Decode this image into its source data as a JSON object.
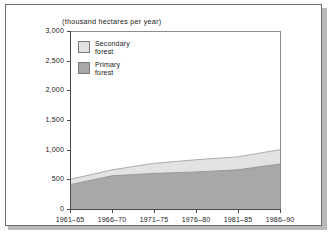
{
  "chart_data": {
    "type": "area",
    "title": "(thousand hectares per year)",
    "xlabel": "",
    "ylabel": "",
    "ylim": [
      0,
      3000
    ],
    "ytick_labels": [
      "0",
      "500",
      "1,000",
      "1,500",
      "2,000",
      "2,500",
      "3,000"
    ],
    "ytick_values": [
      0,
      500,
      1000,
      1500,
      2000,
      2500,
      3000
    ],
    "categories": [
      "1961-65",
      "1966-70",
      "1971-75",
      "1976-80",
      "1981-85",
      "1986-90"
    ],
    "stacked": true,
    "grid": false,
    "legend_position": "upper-left",
    "series": [
      {
        "name": "Primary forest",
        "color": "#a8a8a8",
        "values": [
          410,
          560,
          600,
          625,
          660,
          760
        ]
      },
      {
        "name": "Secondary forest",
        "color": "#e2e2e2",
        "values": [
          90,
          100,
          170,
          205,
          220,
          240
        ]
      }
    ],
    "totals": [
      500,
      660,
      770,
      830,
      880,
      1000
    ]
  },
  "legend": {
    "items": [
      {
        "label": "Secondary\nforest",
        "color": "#e2e2e2"
      },
      {
        "label": "Primary\nforest",
        "color": "#a8a8a8"
      }
    ]
  },
  "colors": {
    "primary_forest": "#a8a8a8",
    "secondary_forest": "#e2e2e2",
    "axis": "#4a4a4a",
    "frame": "#6b6b6b",
    "text": "#1a1a1a",
    "shadow": "#b8b8b8"
  }
}
